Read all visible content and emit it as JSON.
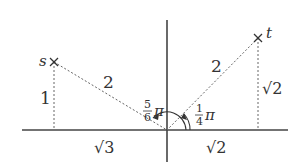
{
  "diagram": {
    "points": [
      {
        "name": "s",
        "label": "s",
        "coords": [
          "-√3",
          "1"
        ],
        "marker": "x"
      },
      {
        "name": "t",
        "label": "t",
        "coords": [
          "√2",
          "√2"
        ],
        "marker": "x"
      }
    ],
    "labels": {
      "s_hyp": "2",
      "s_height": "1",
      "s_base": "√3",
      "t_hyp": "2",
      "t_height": "√2",
      "t_base": "√2",
      "angle_s_num": "5",
      "angle_s_den": "6",
      "angle_s_pi": "π",
      "angle_t_num": "1",
      "angle_t_den": "4",
      "angle_t_pi": "π"
    },
    "colors": {
      "line": "#444444",
      "dashed": "#666666"
    }
  }
}
